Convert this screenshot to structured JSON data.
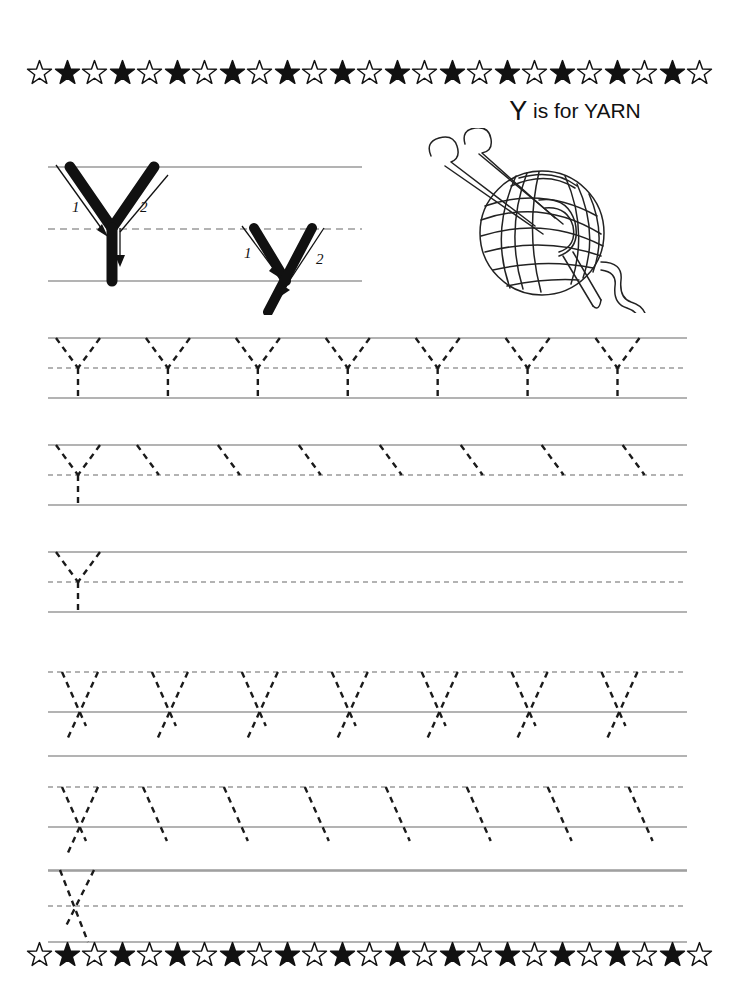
{
  "page": {
    "letter_upper": "Y",
    "letter_lower": "y",
    "width": 739,
    "height": 991,
    "background": "#ffffff",
    "ink": "#111111",
    "rule_color": "#9a9a9a",
    "dotted_color": "#1a1a1a"
  },
  "title": {
    "letter": "Y",
    "text": " is for YARN",
    "full": "Y is for YARN"
  },
  "illustration": {
    "name": "ball-of-yarn-with-knitting-needles",
    "parts": [
      "yarn-ball",
      "knitting-needle-left",
      "knitting-needle-right",
      "needle-tip",
      "trailing-yarn-strand"
    ]
  },
  "border": {
    "name": "star-border",
    "star_count": 25,
    "pattern": "alternating hollow and filled stars",
    "hollow_fill": "#ffffff",
    "filled_fill": "#111111"
  },
  "demo": {
    "uppercase": {
      "letter": "Y",
      "stroke_labels": [
        "1",
        "2"
      ],
      "stroke_count": 2,
      "description": "Uppercase Y model letter with numbered stroke-order arrows"
    },
    "lowercase": {
      "letter": "y",
      "stroke_labels": [
        "1",
        "2"
      ],
      "stroke_count": 2,
      "description": "Lowercase y model letter with numbered stroke-order arrows"
    },
    "guides": [
      "top-line",
      "dashed-midline",
      "baseline"
    ]
  },
  "practice_rows": [
    {
      "id": "row-1",
      "case": "uppercase",
      "letter": "Y",
      "mode": "full-trace",
      "count": 7,
      "label": "Trace seven dotted uppercase Y letters"
    },
    {
      "id": "row-2",
      "case": "uppercase",
      "letter": "Y",
      "mode": "first-letter-full-then-partial",
      "count": 8,
      "label": "One full uppercase Y then seven first-stroke starters"
    },
    {
      "id": "row-3",
      "case": "uppercase",
      "letter": "Y",
      "mode": "single-then-blank",
      "count": 1,
      "label": "One uppercase Y then blank line for free practice"
    },
    {
      "id": "row-4",
      "case": "lowercase",
      "letter": "y",
      "mode": "full-trace",
      "count": 7,
      "label": "Trace seven dotted lowercase y letters"
    },
    {
      "id": "row-5",
      "case": "lowercase",
      "letter": "y",
      "mode": "first-letter-full-then-partial",
      "count": 8,
      "label": "One full lowercase y then seven first-stroke starters"
    },
    {
      "id": "row-6",
      "case": "lowercase",
      "letter": "y",
      "mode": "single-then-blank",
      "count": 1,
      "label": "One lowercase y then blank line for free practice"
    }
  ]
}
